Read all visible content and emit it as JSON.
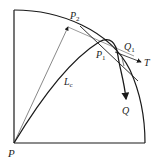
{
  "diagram": {
    "labels": {
      "P": "P",
      "P1": "P",
      "P1_sub": "1",
      "P2": "P",
      "P2_sub": "2",
      "Q1": "Q",
      "Q1_sub": "1",
      "T": "T",
      "Q": "Q",
      "Lc": "L",
      "Lc_sub": "c"
    },
    "colors": {
      "stroke": "#1a1a1a",
      "thin_stroke": "#555555"
    }
  }
}
